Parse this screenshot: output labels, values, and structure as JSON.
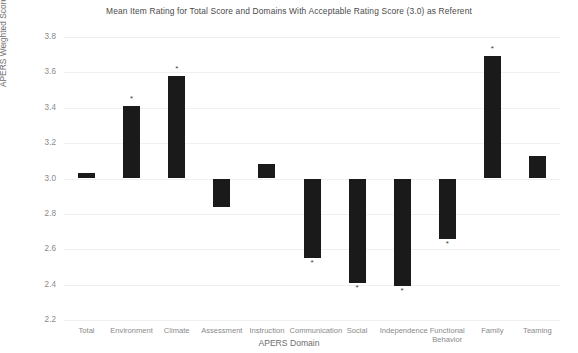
{
  "chart_data": {
    "type": "bar",
    "title": "Mean Item Rating for Total Score and Domains With Acceptable Rating Score (3.0) as Referent",
    "xlabel": "APERS Domain",
    "ylabel": "APERS Weighted Score",
    "ylim": [
      2.2,
      3.8
    ],
    "ytick_labels": [
      "3.8",
      "3.6",
      "3.4",
      "3.2",
      "3.0",
      "2.8",
      "2.6",
      "2.4",
      "2.2"
    ],
    "ytick_values": [
      3.8,
      3.6,
      3.4,
      3.2,
      3.0,
      2.8,
      2.6,
      2.4,
      2.2
    ],
    "baseline": 3.0,
    "grid": true,
    "legend": "none",
    "bar_color": "#1a1a1a",
    "significance_marker": "*",
    "categories": [
      "Total",
      "Environment",
      "Climate",
      "Assessment",
      "Instruction",
      "Communication",
      "Social",
      "Independence",
      "Functional Behavior",
      "Family",
      "Teaming"
    ],
    "category_labels": [
      "Total",
      "Environment",
      "Climate",
      "Assessment",
      "Instruction",
      "Communication",
      "Social",
      "Independence",
      "Functional\nBehavior",
      "Family",
      "Teaming"
    ],
    "values": [
      3.03,
      3.41,
      3.58,
      2.84,
      3.08,
      2.55,
      2.41,
      2.39,
      2.66,
      3.69,
      3.13
    ],
    "significant": [
      false,
      true,
      true,
      false,
      false,
      true,
      true,
      true,
      true,
      true,
      false
    ]
  }
}
